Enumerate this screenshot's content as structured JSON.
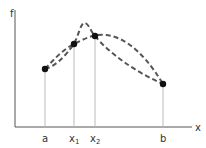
{
  "diagram": {
    "axes": {
      "y_label": "f",
      "x_label": "x",
      "axis_color": "#555555"
    },
    "points": [
      {
        "id": "a",
        "label": "a",
        "subscript": "",
        "x": 45,
        "y": 69
      },
      {
        "id": "x1",
        "label": "x",
        "subscript": "1",
        "x": 74,
        "y": 44
      },
      {
        "id": "x2",
        "label": "x",
        "subscript": "2",
        "x": 95,
        "y": 36
      },
      {
        "id": "b",
        "label": "b",
        "subscript": "",
        "x": 163,
        "y": 84
      }
    ],
    "curves": [
      {
        "name": "curve-peaked",
        "style": "dashed",
        "color": "#555555"
      },
      {
        "name": "curve-smooth",
        "style": "dashed",
        "color": "#555555"
      }
    ],
    "point_color": "#111111",
    "guide_color": "#bbbbbb"
  }
}
